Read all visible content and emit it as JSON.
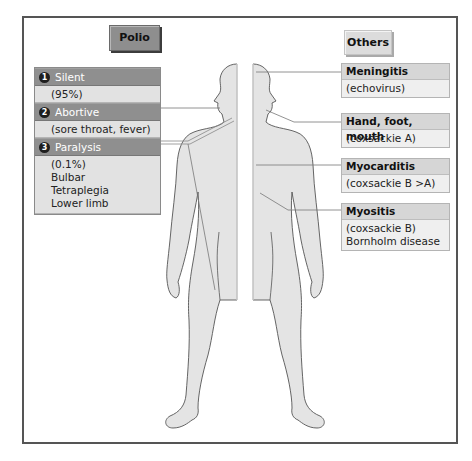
{
  "left_panel": {
    "tag": "Polio",
    "sections": [
      {
        "number": "1",
        "title": "Silent",
        "details": [
          "(95%)"
        ]
      },
      {
        "number": "2",
        "title": "Abortive",
        "details": [
          "(sore throat, fever)"
        ]
      },
      {
        "number": "3",
        "title": "Paralysis",
        "details": [
          "(0.1%)",
          "Bulbar",
          "Tetraplegia",
          "Lower limb"
        ]
      }
    ]
  },
  "right_panel": {
    "tag": "Others",
    "boxes": [
      {
        "title": "Meningitis",
        "details": [
          "(echovirus)"
        ]
      },
      {
        "title": "Hand, foot, mouth",
        "details": [
          "(coxsackie A)"
        ]
      },
      {
        "title": "Myocarditis",
        "details": [
          "(coxsackie B >A)"
        ]
      },
      {
        "title": "Myositis",
        "details": [
          "(coxsackie B)",
          "Bornholm disease"
        ]
      }
    ]
  },
  "colors": {
    "polio_tag": "#8e8e8e",
    "others_tag": "#dcdcdc",
    "left_header": "#8f8f8f",
    "left_body": "#e2e2e2",
    "right_header": "#d6d6d6",
    "right_body": "#efefef",
    "body_fill": "#e4e4e4"
  }
}
